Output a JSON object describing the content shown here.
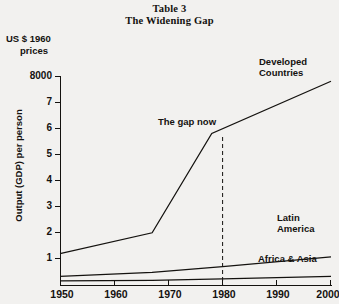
{
  "title": {
    "line1": "Table 3",
    "line2": "The Widening Gap"
  },
  "units": {
    "line1": "US $ 1960",
    "line2": "prices"
  },
  "axis": {
    "ylabel": "Output (GDP) per person",
    "xlabel": ""
  },
  "annotations": {
    "gap_now": "The gap now",
    "gap_now_year": 1980
  },
  "chart_data": {
    "type": "line",
    "title": "The Widening Gap",
    "subtitle": "Table 3",
    "xlabel": "",
    "ylabel": "Output (GDP) per person",
    "units": "US $ 1960 prices",
    "xlim": [
      1950,
      2000
    ],
    "ylim": [
      0,
      8000
    ],
    "xticks": [
      1950,
      1960,
      1970,
      1980,
      1990,
      2000
    ],
    "yticks": [
      1000,
      2000,
      3000,
      4000,
      5000,
      6000,
      7000,
      8000
    ],
    "ytick_labels": [
      "1",
      "2",
      "3",
      "4",
      "5",
      "6",
      "7",
      "8000"
    ],
    "grid": false,
    "legend": "inline-labels",
    "annotations": [
      {
        "text": "The gap now",
        "year": 1980,
        "type": "dashed-vertical-line"
      }
    ],
    "series": [
      {
        "name": "Developed Countries",
        "x": [
          1950,
          1967,
          1978,
          2000
        ],
        "values": [
          1200,
          2000,
          5800,
          7800
        ]
      },
      {
        "name": "Latin America",
        "x": [
          1950,
          1967,
          1980,
          2000
        ],
        "values": [
          330,
          480,
          700,
          1080
        ]
      },
      {
        "name": "Africa & Asia",
        "x": [
          1950,
          1967,
          1980,
          2000
        ],
        "values": [
          160,
          175,
          230,
          330
        ]
      }
    ]
  }
}
